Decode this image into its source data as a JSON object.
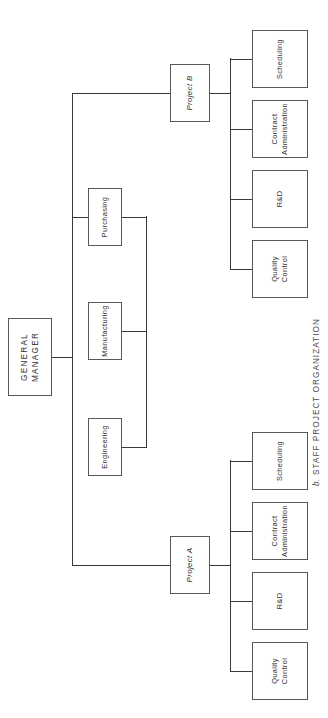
{
  "figure": {
    "caption_lead": "b.",
    "caption_text": "STAFF PROJECT ORGANIZATION",
    "caption_full": "b. STAFF PROJECT ORGANIZATION",
    "orientation": "rotated-90-counterclockwise",
    "background_color": "#ffffff",
    "line_color": "#3a3a3c",
    "box_border_color": "#58585a",
    "text_color": "#2f2f31"
  },
  "root": {
    "label_line1": "GENERAL",
    "label_line2": "MANAGER"
  },
  "projects": [
    {
      "id": "project-a",
      "label": "Project A",
      "children": [
        {
          "id": "a-quality-control",
          "line1": "Quality",
          "line2": "Control"
        },
        {
          "id": "a-rnd",
          "line1": "R&D",
          "line2": ""
        },
        {
          "id": "a-contract-administration",
          "line1": "Contract",
          "line2": "Administration"
        },
        {
          "id": "a-scheduling",
          "line1": "Scheduling",
          "line2": ""
        }
      ]
    },
    {
      "id": "project-b",
      "label": "Project B",
      "children": [
        {
          "id": "b-quality-control",
          "line1": "Quality",
          "line2": "Control"
        },
        {
          "id": "b-rnd",
          "line1": "R&D",
          "line2": ""
        },
        {
          "id": "b-contract-administration",
          "line1": "Contract",
          "line2": "Administration"
        },
        {
          "id": "b-scheduling",
          "line1": "Scheduling",
          "line2": ""
        }
      ]
    }
  ],
  "functions": [
    {
      "id": "engineering",
      "label": "Engineering"
    },
    {
      "id": "manufacturing",
      "label": "Manufacturing"
    },
    {
      "id": "purchasing",
      "label": "Purchasing"
    }
  ],
  "page_header": {
    "faint_text": ""
  }
}
